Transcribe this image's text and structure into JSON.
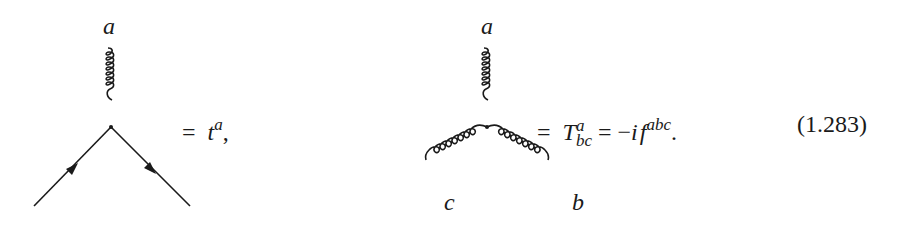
{
  "equation": {
    "number": "(1.283)",
    "left_vertex": {
      "type": "quark-gluon vertex",
      "gluon_label": "a",
      "rhs_eq": "=",
      "rhs_symbol": "t",
      "rhs_sup": "a",
      "rhs_punct": ","
    },
    "right_vertex": {
      "type": "three-gluon vertex",
      "gluon_labels": {
        "top": "a",
        "left": "c",
        "right": "b"
      },
      "rhs_eq1": "=",
      "rhs_symbol": "T",
      "rhs_sup": "a",
      "rhs_sub": "bc",
      "rhs_eq2": "=",
      "rhs_minus": "−",
      "rhs_i": "i",
      "rhs_f": "f",
      "rhs_f_sup": "abc",
      "rhs_punct": "."
    }
  },
  "colors": {
    "ink": "#1a1a1a",
    "background": "#ffffff"
  }
}
